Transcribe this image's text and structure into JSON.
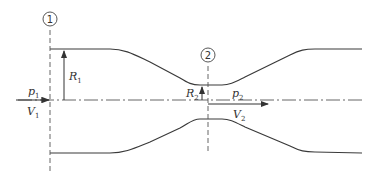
{
  "diagram": {
    "sections": [
      {
        "id": "1",
        "label": "1",
        "x": 50
      },
      {
        "id": "2",
        "label": "2",
        "x": 208
      }
    ],
    "labels": {
      "p1": "p",
      "p1_sub": "1",
      "V1": "V",
      "V1_sub": "1",
      "R1": "R",
      "R1_sub": "1",
      "R2": "R",
      "R2_sub": "2",
      "p2": "p",
      "p2_sub": "2",
      "V2": "V",
      "V2_sub": "2"
    },
    "colors": {
      "line": "#3a3a3a",
      "dash": "#555555"
    }
  }
}
